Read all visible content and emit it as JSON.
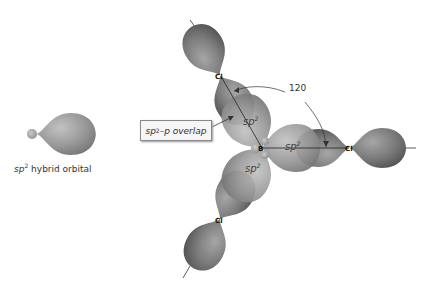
{
  "figure": {
    "labels": {
      "hybrid_orbital_caption": {
        "prefix": "sp",
        "sup": "2",
        "suffix": " hybrid orbital"
      },
      "overlap_callout": {
        "prefix": "sp",
        "sup": "2",
        "suffix": "–p overlap"
      },
      "angle": "120",
      "orbital_labels": [
        {
          "prefix": "sp",
          "sup": "2",
          "position": "upper"
        },
        {
          "prefix": "sp",
          "sup": "2",
          "position": "right"
        },
        {
          "prefix": "sp",
          "sup": "2",
          "position": "lower"
        }
      ]
    },
    "atoms": {
      "center": "B",
      "ligands": [
        "Cl",
        "Cl",
        "Cl"
      ]
    },
    "colors": {
      "orbital_dark": "#6e6e6e",
      "orbital_mid": "#8c8c8c",
      "orbital_light": "#b0b0b0",
      "line": "#333333",
      "background": "#ffffff"
    }
  }
}
